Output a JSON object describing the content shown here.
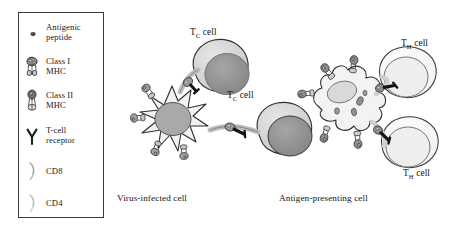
{
  "figure": {
    "title_present": false,
    "background_color": "#ffffff",
    "border_color": "#3a3a3a"
  },
  "legend": {
    "items": [
      {
        "icon": "antigenic-peptide-icon",
        "line1": "Antigenic",
        "line2": "peptide"
      },
      {
        "icon": "class-i-mhc-icon",
        "line1": "Class I",
        "line2": "MHC"
      },
      {
        "icon": "class-ii-mhc-icon",
        "line1": "Class II",
        "line2": "MHC"
      },
      {
        "icon": "t-cell-receptor-icon",
        "line1": "T-cell",
        "line2": "receptor"
      },
      {
        "icon": "cd8-icon",
        "line1": "CD8",
        "line2": ""
      },
      {
        "icon": "cd4-icon",
        "line1": "CD4",
        "line2": ""
      }
    ]
  },
  "panels": {
    "left": {
      "caption": "Virus-infected cell",
      "cell_name": "virus-infected-cell",
      "partners": [
        {
          "label_main": "T",
          "label_sub": "C",
          "label_tail": " cell",
          "name": "tc-cell-upper"
        },
        {
          "label_main": "T",
          "label_sub": "C",
          "label_tail": " cell",
          "name": "tc-cell-lower"
        }
      ]
    },
    "right": {
      "caption": "Antigen-presenting cell",
      "cell_name": "antigen-presenting-cell",
      "partners": [
        {
          "label_main": "T",
          "label_sub": "H",
          "label_tail": " cell",
          "name": "th-cell-upper"
        },
        {
          "label_main": "T",
          "label_sub": "H",
          "label_tail": " cell",
          "name": "th-cell-lower"
        }
      ]
    }
  },
  "colors": {
    "outline": "#2b2b2b",
    "cytoplasm_light": "#f2f2f0",
    "cytoplasm_mid": "#dcdcda",
    "nucleus_dark": "#8e8e8e",
    "nucleus_mid": "#a8a8a6",
    "nucleus_light": "#e2e2e0",
    "mhc_fill": "#9a9a98",
    "bridge_dark": "#222222"
  }
}
